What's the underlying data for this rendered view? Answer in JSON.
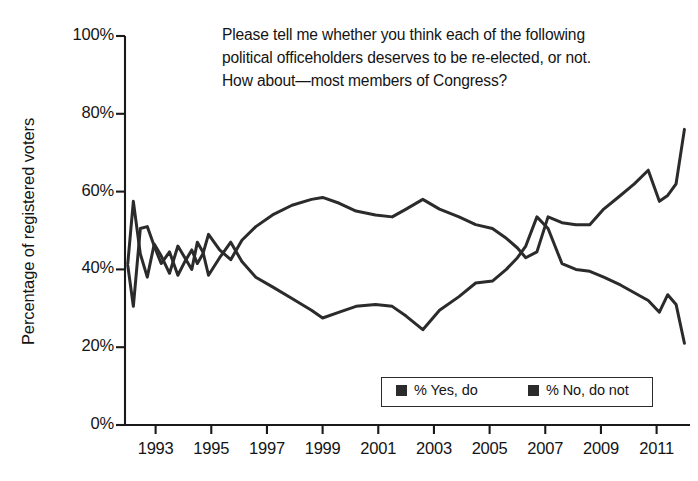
{
  "chart_data": {
    "type": "line",
    "title": "Please tell me whether you think each of the following political officeholders deserves to be re-elected, or not. How about—most members of Congress?",
    "title_lines": [
      "Please tell me whether you think each of the following",
      "political officeholders deserves to be re-elected, or not.",
      "How about—most members of Congress?"
    ],
    "xlabel": "",
    "ylabel": "Percentage of registered voters",
    "ylim": [
      0,
      100
    ],
    "xlim": [
      1991.9,
      2012.2
    ],
    "grid": false,
    "legend_position": "bottom-right",
    "ytick_labels": [
      "0%",
      "20%",
      "40%",
      "60%",
      "80%",
      "100%"
    ],
    "ytick_values": [
      0,
      20,
      40,
      60,
      80,
      100
    ],
    "xtick_labels": [
      "1993",
      "1995",
      "1997",
      "1999",
      "2001",
      "2003",
      "2005",
      "2007",
      "2009",
      "2011"
    ],
    "xtick_values": [
      1993,
      1995,
      1997,
      1999,
      2001,
      2003,
      2005,
      2007,
      2009,
      2011
    ],
    "series": [
      {
        "name": "% Yes, do",
        "color": "#2b2b2b",
        "x": [
          1992.0,
          1992.2,
          1992.45,
          1992.7,
          1992.95,
          1993.2,
          1993.5,
          1993.8,
          1994.05,
          1994.3,
          1994.5,
          1994.7,
          1994.9,
          1995.3,
          1995.7,
          1996.1,
          1996.6,
          1997.2,
          1997.9,
          1998.6,
          1999.0,
          1999.6,
          2000.2,
          2000.9,
          2001.5,
          2002.0,
          2002.6,
          2003.2,
          2003.9,
          2004.5,
          2005.1,
          2005.6,
          2006.0,
          2006.3,
          2006.7,
          2007.1,
          2007.6,
          2008.1,
          2008.6,
          2009.1,
          2009.7,
          2010.2,
          2010.7,
          2011.1,
          2011.4,
          2011.7,
          2012.0
        ],
        "y": [
          41.5,
          57.5,
          44.0,
          38.0,
          46.5,
          43.5,
          39.0,
          46.0,
          43.0,
          40.0,
          47.0,
          44.5,
          38.5,
          43.0,
          47.0,
          42.0,
          38.0,
          35.5,
          32.5,
          29.5,
          27.5,
          29.0,
          30.5,
          31.0,
          30.5,
          28.0,
          24.5,
          29.5,
          33.0,
          36.5,
          37.0,
          40.0,
          43.0,
          46.0,
          53.5,
          50.5,
          41.5,
          40.0,
          39.5,
          38.0,
          36.0,
          34.0,
          32.0,
          29.0,
          33.5,
          31.0,
          21.0
        ]
      },
      {
        "name": "% No, do not",
        "color": "#2b2b2b",
        "x": [
          1992.0,
          1992.2,
          1992.45,
          1992.7,
          1992.95,
          1993.2,
          1993.5,
          1993.8,
          1994.05,
          1994.3,
          1994.5,
          1994.7,
          1994.9,
          1995.3,
          1995.7,
          1996.1,
          1996.6,
          1997.2,
          1997.9,
          1998.6,
          1999.0,
          1999.6,
          2000.2,
          2000.9,
          2001.5,
          2002.0,
          2002.6,
          2003.2,
          2003.9,
          2004.5,
          2005.1,
          2005.6,
          2006.0,
          2006.3,
          2006.7,
          2007.1,
          2007.6,
          2008.1,
          2008.6,
          2009.1,
          2009.7,
          2010.2,
          2010.7,
          2011.1,
          2011.4,
          2011.7,
          2012.0
        ],
        "y": [
          41.0,
          30.5,
          50.5,
          51.0,
          46.0,
          41.5,
          44.5,
          38.5,
          42.0,
          45.0,
          41.5,
          44.0,
          49.0,
          45.0,
          42.5,
          47.5,
          51.0,
          54.0,
          56.5,
          58.0,
          58.5,
          57.0,
          55.0,
          54.0,
          53.5,
          55.5,
          58.0,
          55.5,
          53.5,
          51.5,
          50.5,
          48.0,
          45.5,
          43.0,
          44.5,
          53.5,
          52.0,
          51.5,
          51.5,
          55.5,
          59.0,
          62.0,
          65.5,
          57.5,
          59.0,
          62.0,
          76.0
        ]
      }
    ]
  },
  "axis": {
    "y_title": "Percentage of registered voters"
  },
  "legend": {
    "items": [
      {
        "label": "% Yes, do",
        "swatch": "square-marker"
      },
      {
        "label": "% No, do not",
        "swatch": "square-marker"
      }
    ]
  },
  "colors": {
    "line": "#2b2b2b",
    "axis": "#1a1a1a",
    "background": "#ffffff"
  }
}
